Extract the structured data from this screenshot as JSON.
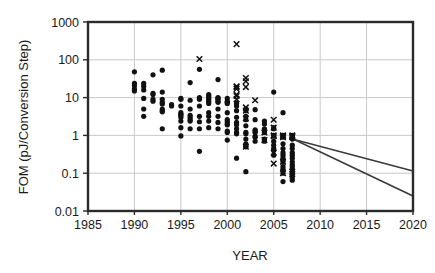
{
  "chart_data": {
    "type": "scatter",
    "title": "",
    "xlabel": "YEAR",
    "ylabel": "FOM (pJ/Conversion Step)",
    "xlim": [
      1985,
      2020
    ],
    "ylim": [
      0.01,
      1000
    ],
    "yscale": "log",
    "xticks": [
      1985,
      1990,
      1995,
      2000,
      2005,
      2010,
      2015,
      2020
    ],
    "xtick_labels": [
      "1985",
      "1990",
      "1995",
      "2000",
      "2005",
      "2010",
      "2015",
      "2020"
    ],
    "yticks": [
      0.01,
      0.1,
      1,
      10,
      100,
      1000
    ],
    "ytick_labels": [
      "0.01",
      "0.1",
      "1",
      "10",
      "100",
      "1000"
    ],
    "grid": "horizontal-and-vertical",
    "legend": "none",
    "series": [
      {
        "name": "ISSCC publications",
        "marker": "circle",
        "color": "#111111",
        "points": [
          [
            1990,
            48
          ],
          [
            1990,
            24
          ],
          [
            1990,
            21
          ],
          [
            1990,
            17
          ],
          [
            1990,
            15
          ],
          [
            1991,
            24
          ],
          [
            1991,
            20
          ],
          [
            1991,
            16
          ],
          [
            1991,
            9.5
          ],
          [
            1991,
            5.0
          ],
          [
            1991,
            3.2
          ],
          [
            1992,
            40
          ],
          [
            1992,
            13
          ],
          [
            1992,
            12
          ],
          [
            1992,
            9.0
          ],
          [
            1992,
            8.0
          ],
          [
            1993,
            53
          ],
          [
            1993,
            14
          ],
          [
            1993,
            9.0
          ],
          [
            1993,
            7.5
          ],
          [
            1993,
            6.8
          ],
          [
            1993,
            5.0
          ],
          [
            1993,
            4.5
          ],
          [
            1993,
            4.2
          ],
          [
            1993,
            1.5
          ],
          [
            1994,
            6.5
          ],
          [
            1994,
            6.0
          ],
          [
            1995,
            9.5
          ],
          [
            1995,
            9.0
          ],
          [
            1995,
            6.0
          ],
          [
            1995,
            4.0
          ],
          [
            1995,
            3.6
          ],
          [
            1995,
            3.4
          ],
          [
            1995,
            3.0
          ],
          [
            1995,
            2.4
          ],
          [
            1995,
            1.6
          ],
          [
            1995,
            0.97
          ],
          [
            1996,
            25
          ],
          [
            1996,
            8.5
          ],
          [
            1996,
            5.0
          ],
          [
            1996,
            3.4
          ],
          [
            1996,
            3.0
          ],
          [
            1996,
            2.6
          ],
          [
            1996,
            2.4
          ],
          [
            1996,
            1.5
          ],
          [
            1997,
            56
          ],
          [
            1997,
            10
          ],
          [
            1997,
            9.0
          ],
          [
            1997,
            6.0
          ],
          [
            1997,
            3.2
          ],
          [
            1997,
            2.3
          ],
          [
            1997,
            1.5
          ],
          [
            1997,
            0.38
          ],
          [
            1998,
            12
          ],
          [
            1998,
            11
          ],
          [
            1998,
            10
          ],
          [
            1998,
            9.0
          ],
          [
            1998,
            8.0
          ],
          [
            1998,
            7.0
          ],
          [
            1998,
            4.0
          ],
          [
            1998,
            3.2
          ],
          [
            1998,
            2.4
          ],
          [
            1998,
            1.6
          ],
          [
            1999,
            30
          ],
          [
            1999,
            10
          ],
          [
            1999,
            9.5
          ],
          [
            1999,
            9.0
          ],
          [
            1999,
            8.0
          ],
          [
            1999,
            7.5
          ],
          [
            1999,
            5.0
          ],
          [
            1999,
            3.2
          ],
          [
            1999,
            2.2
          ],
          [
            1999,
            1.5
          ],
          [
            2000,
            9.5
          ],
          [
            2000,
            8.0
          ],
          [
            2000,
            7.5
          ],
          [
            2000,
            7.0
          ],
          [
            2000,
            4.0
          ],
          [
            2000,
            2.6
          ],
          [
            2000,
            2.3
          ],
          [
            2000,
            2.0
          ],
          [
            2000,
            1.9
          ],
          [
            2000,
            1.3
          ],
          [
            2000,
            1.2
          ],
          [
            2000,
            0.75
          ],
          [
            2001,
            7.0
          ],
          [
            2001,
            6.0
          ],
          [
            2001,
            4.5
          ],
          [
            2001,
            3.0
          ],
          [
            2001,
            2.2
          ],
          [
            2001,
            1.9
          ],
          [
            2001,
            1.5
          ],
          [
            2001,
            1.2
          ],
          [
            2001,
            1.1
          ],
          [
            2001,
            0.25
          ],
          [
            2002,
            5.0
          ],
          [
            2002,
            4.5
          ],
          [
            2002,
            3.2
          ],
          [
            2002,
            2.6
          ],
          [
            2002,
            1.8
          ],
          [
            2002,
            1.2
          ],
          [
            2002,
            1.1
          ],
          [
            2002,
            0.8
          ],
          [
            2002,
            0.6
          ],
          [
            2002,
            0.52
          ],
          [
            2002,
            0.5
          ],
          [
            2002,
            0.11
          ],
          [
            2003,
            4.8
          ],
          [
            2003,
            2.6
          ],
          [
            2003,
            1.4
          ],
          [
            2003,
            1.3
          ],
          [
            2003,
            1.2
          ],
          [
            2003,
            0.95
          ],
          [
            2003,
            0.9
          ],
          [
            2003,
            0.7
          ],
          [
            2004,
            2.4
          ],
          [
            2004,
            2.0
          ],
          [
            2004,
            1.5
          ],
          [
            2004,
            1.3
          ],
          [
            2004,
            1.2
          ],
          [
            2004,
            0.8
          ],
          [
            2004,
            0.75
          ],
          [
            2004,
            0.7
          ],
          [
            2005,
            14
          ],
          [
            2005,
            1.6
          ],
          [
            2005,
            1.5
          ],
          [
            2005,
            1.0
          ],
          [
            2005,
            0.95
          ],
          [
            2005,
            0.7
          ],
          [
            2005,
            0.55
          ],
          [
            2005,
            0.45
          ],
          [
            2005,
            0.4
          ],
          [
            2005,
            0.3
          ],
          [
            2006,
            4.0
          ],
          [
            2006,
            1.0
          ],
          [
            2006,
            0.95
          ],
          [
            2006,
            0.9
          ],
          [
            2006,
            0.6
          ],
          [
            2006,
            0.45
          ],
          [
            2006,
            0.35
          ],
          [
            2006,
            0.3
          ],
          [
            2006,
            0.25
          ],
          [
            2006,
            0.22
          ],
          [
            2006,
            0.2
          ],
          [
            2006,
            0.15
          ],
          [
            2006,
            0.13
          ],
          [
            2006,
            0.12
          ],
          [
            2006,
            0.1
          ],
          [
            2006,
            0.06
          ],
          [
            2007,
            1.0
          ],
          [
            2007,
            0.95
          ],
          [
            2007,
            0.9
          ],
          [
            2007,
            0.8
          ],
          [
            2007,
            0.55
          ],
          [
            2007,
            0.45
          ],
          [
            2007,
            0.35
          ],
          [
            2007,
            0.3
          ],
          [
            2007,
            0.25
          ],
          [
            2007,
            0.2
          ],
          [
            2007,
            0.17
          ],
          [
            2007,
            0.15
          ],
          [
            2007,
            0.13
          ],
          [
            2007,
            0.11
          ],
          [
            2007,
            0.09
          ],
          [
            2007,
            0.075
          ],
          [
            2007,
            0.065
          ]
        ]
      },
      {
        "name": "VLSI publications",
        "marker": "cross",
        "color": "#111111",
        "points": [
          [
            1997,
            105
          ],
          [
            2001,
            260
          ],
          [
            2001,
            20
          ],
          [
            2001,
            19
          ],
          [
            2001,
            17
          ],
          [
            2001,
            12
          ],
          [
            2001,
            11
          ],
          [
            2001,
            9.0
          ],
          [
            2002,
            33
          ],
          [
            2002,
            27
          ],
          [
            2002,
            19
          ],
          [
            2002,
            5.5
          ],
          [
            2002,
            4.5
          ],
          [
            2002,
            2.8
          ],
          [
            2002,
            0.5
          ],
          [
            2003,
            8.5
          ],
          [
            2004,
            1.2
          ],
          [
            2004,
            0.75
          ],
          [
            2005,
            2.6
          ],
          [
            2005,
            1.6
          ],
          [
            2005,
            1.0
          ],
          [
            2005,
            0.95
          ],
          [
            2005,
            0.35
          ],
          [
            2005,
            0.18
          ],
          [
            2006,
            1.0
          ],
          [
            2006,
            0.95
          ],
          [
            2006,
            0.9
          ],
          [
            2006,
            0.2
          ],
          [
            2006,
            0.1
          ],
          [
            2007,
            1.0
          ],
          [
            2007,
            0.95
          ],
          [
            2007,
            0.9
          ],
          [
            2007,
            0.11
          ],
          [
            2007,
            0.095
          ]
        ]
      }
    ],
    "trend_lines": [
      {
        "name": "upper-trend-line",
        "color": "#3a3a3a",
        "points": [
          [
            2007.2,
            0.78
          ],
          [
            2020,
            0.115
          ]
        ]
      },
      {
        "name": "lower-trend-line",
        "color": "#3a3a3a",
        "points": [
          [
            2007.2,
            0.78
          ],
          [
            2020,
            0.025
          ]
        ]
      }
    ]
  }
}
